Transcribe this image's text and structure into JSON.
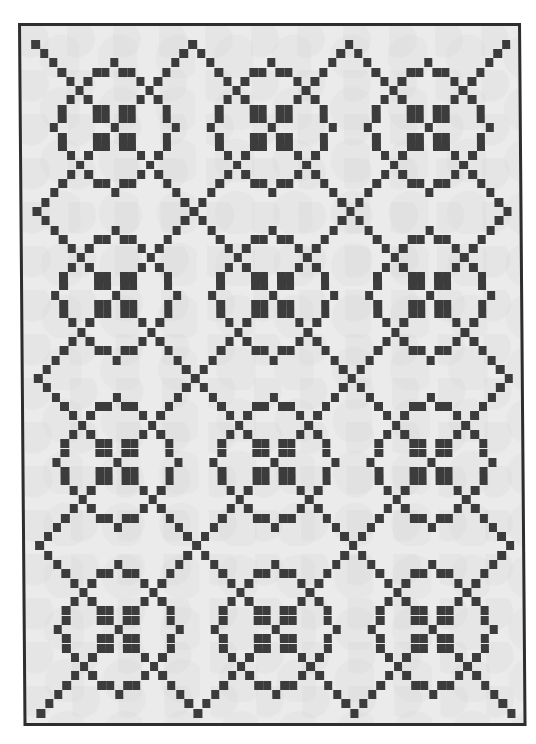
{
  "image": {
    "subject": "Black and white pixelated quilt with ring-and-chain pattern",
    "background_color": "#ffffff",
    "fabric_color": "#ebebeb",
    "piece_color": "#3c3c3c",
    "binding_color": "#2e2e2e"
  },
  "quilt": {
    "blocks_across": 3,
    "blocks_down": 4,
    "block_period_units": 18,
    "cell_width_px": 8.72,
    "cell_height_px": 9.29,
    "first_block_center_px": [
      93,
      102
    ],
    "block_pattern_cells": {
      "center": [
        [
          0,
          0
        ]
      ],
      "four_patch_squares": "all (a,b) with |a|,|b| in {1,2}",
      "ring": "(±6,±1),(±6,±2),(±1,±6),(±2,±6),(0,±7),(±7,0)",
      "diagonals": "(±k,±k) for k=3..9 plus (±3,±5),(±5,±3)"
    }
  }
}
